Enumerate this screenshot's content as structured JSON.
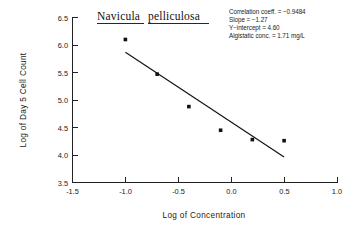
{
  "chart_data": {
    "type": "scatter",
    "title": "Navicula pelliculosa",
    "title_words": [
      "Navicula",
      "pelliculosa"
    ],
    "xlabel": "Log of Concentration",
    "ylabel": "Log of Day 5 Cell Count",
    "xlim": [
      -1.5,
      1.0
    ],
    "ylim": [
      3.5,
      6.5
    ],
    "xticks": [
      -1.5,
      -1.0,
      -0.5,
      0.0,
      0.5,
      1.0
    ],
    "xtick_labels": [
      "-1.5",
      "-1.0",
      "-0.5",
      "0.0",
      "0.5",
      "1.0"
    ],
    "yticks": [
      3.5,
      4.0,
      4.5,
      5.0,
      5.5,
      6.0,
      6.5
    ],
    "ytick_labels": [
      "3.5",
      "4.0",
      "4.5",
      "5.0",
      "5.5",
      "6.0",
      "6.5"
    ],
    "grid": false,
    "legend": "none",
    "points": [
      {
        "x": -1.0,
        "y": 6.1
      },
      {
        "x": -0.7,
        "y": 5.47
      },
      {
        "x": -0.4,
        "y": 4.88
      },
      {
        "x": -0.1,
        "y": 4.45
      },
      {
        "x": 0.2,
        "y": 4.28
      },
      {
        "x": 0.5,
        "y": 4.26
      }
    ],
    "fit_line": {
      "slope": -1.27,
      "intercept": 4.6,
      "x_start": -1.0,
      "x_end": 0.5,
      "y_start": 5.87,
      "y_end": 3.965
    }
  },
  "annotations": {
    "lines": [
      "Correlation coeff. = −0.9484",
      "Slope  =  −1.27",
      "Y−intercept  =  4.60",
      "Algistatic conc.  =  1.71 mg/L"
    ],
    "correlation_coefficient": "-0.9484",
    "slope": "-1.27",
    "y_intercept": "4.60",
    "algistatic_concentration": "1.71 mg/L"
  }
}
